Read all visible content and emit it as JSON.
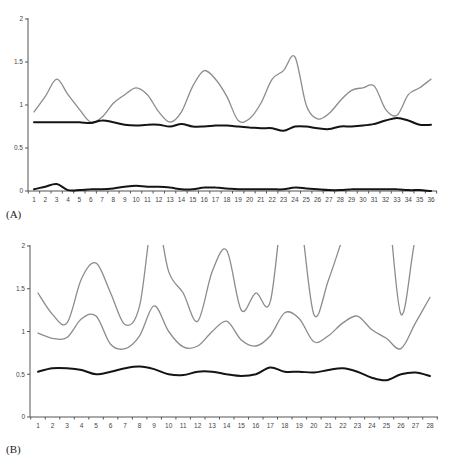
{
  "chart_data": [
    {
      "type": "line",
      "panel_label": "(A)",
      "title": "",
      "xlabel": "",
      "ylabel": "",
      "x": [
        1,
        2,
        3,
        4,
        5,
        6,
        7,
        8,
        9,
        10,
        11,
        12,
        13,
        14,
        15,
        16,
        17,
        18,
        19,
        20,
        21,
        22,
        23,
        24,
        25,
        26,
        27,
        28,
        29,
        30,
        31,
        32,
        33,
        34,
        35,
        36
      ],
      "xticks": [
        "1",
        "2",
        "3",
        "4",
        "5",
        "6",
        "7",
        "8",
        "9",
        "10",
        "11",
        "12",
        "13",
        "14",
        "15",
        "16",
        "17",
        "18",
        "19",
        "20",
        "21",
        "22",
        "23",
        "24",
        "25",
        "26",
        "27",
        "28",
        "29",
        "30",
        "31",
        "32",
        "33",
        "34",
        "35",
        "36"
      ],
      "yticks": [
        "0",
        "0.5",
        "1",
        "1.5",
        "2"
      ],
      "ytick_values": [
        0,
        0.5,
        1,
        1.5,
        2
      ],
      "ylim": [
        0,
        2
      ],
      "grid": false,
      "legend": "none",
      "series": [
        {
          "name": "grey-upper",
          "color": "#8c8c8c",
          "values": [
            0.92,
            1.1,
            1.3,
            1.12,
            0.95,
            0.8,
            0.86,
            1.02,
            1.12,
            1.2,
            1.12,
            0.92,
            0.8,
            0.92,
            1.22,
            1.4,
            1.3,
            1.1,
            0.82,
            0.84,
            1.02,
            1.3,
            1.4,
            1.56,
            1.0,
            0.84,
            0.9,
            1.05,
            1.17,
            1.2,
            1.22,
            0.95,
            0.88,
            1.12,
            1.2,
            1.3
          ]
        },
        {
          "name": "black-middle",
          "color": "#141414",
          "values": [
            0.8,
            0.8,
            0.8,
            0.8,
            0.8,
            0.79,
            0.82,
            0.8,
            0.77,
            0.76,
            0.77,
            0.77,
            0.75,
            0.78,
            0.75,
            0.75,
            0.76,
            0.76,
            0.75,
            0.74,
            0.73,
            0.73,
            0.7,
            0.75,
            0.75,
            0.73,
            0.72,
            0.75,
            0.75,
            0.76,
            0.78,
            0.82,
            0.85,
            0.82,
            0.77,
            0.77
          ]
        },
        {
          "name": "black-lower",
          "color": "#141414",
          "values": [
            0.02,
            0.05,
            0.08,
            0.01,
            0.01,
            0.02,
            0.02,
            0.03,
            0.05,
            0.06,
            0.05,
            0.05,
            0.04,
            0.02,
            0.02,
            0.04,
            0.04,
            0.03,
            0.02,
            0.02,
            0.02,
            0.02,
            0.02,
            0.04,
            0.03,
            0.02,
            0.01,
            0.01,
            0.02,
            0.02,
            0.02,
            0.02,
            0.02,
            0.01,
            0.01,
            0.0
          ]
        }
      ]
    },
    {
      "type": "line",
      "panel_label": "(B)",
      "title": "",
      "xlabel": "",
      "ylabel": "",
      "x": [
        1,
        2,
        3,
        4,
        5,
        6,
        7,
        8,
        9,
        10,
        11,
        12,
        13,
        14,
        15,
        16,
        17,
        18,
        19,
        20,
        21,
        22,
        23,
        24,
        25,
        26,
        27,
        28
      ],
      "xticks": [
        "1",
        "2",
        "3",
        "4",
        "5",
        "6",
        "7",
        "8",
        "9",
        "10",
        "11",
        "12",
        "13",
        "14",
        "15",
        "16",
        "17",
        "18",
        "19",
        "20",
        "21",
        "22",
        "23",
        "24",
        "25",
        "26",
        "27",
        "28"
      ],
      "yticks": [
        "0",
        "0.5",
        "1",
        "1.5",
        "2"
      ],
      "ytick_values": [
        0,
        0.5,
        1,
        1.5,
        2
      ],
      "ylim": [
        0,
        2
      ],
      "grid": false,
      "legend": "none",
      "clipped_above_ylim": true,
      "series": [
        {
          "name": "grey-upper",
          "color": "#8c8c8c",
          "values": [
            1.45,
            1.2,
            1.1,
            1.62,
            1.8,
            1.45,
            1.08,
            1.3,
            2.4,
            1.7,
            1.45,
            1.12,
            1.7,
            1.95,
            1.25,
            1.45,
            1.35,
            2.6,
            2.4,
            1.2,
            1.6,
            2.1,
            2.6,
            2.6,
            2.6,
            1.2,
            2.1,
            2.6
          ]
        },
        {
          "name": "grey-middle",
          "color": "#8c8c8c",
          "values": [
            0.98,
            0.92,
            0.93,
            1.15,
            1.18,
            0.85,
            0.8,
            0.95,
            1.3,
            1.0,
            0.82,
            0.83,
            1.0,
            1.12,
            0.9,
            0.83,
            0.95,
            1.22,
            1.15,
            0.88,
            0.95,
            1.1,
            1.18,
            1.02,
            0.92,
            0.8,
            1.1,
            1.4
          ]
        },
        {
          "name": "black-lower",
          "color": "#141414",
          "values": [
            0.53,
            0.57,
            0.57,
            0.55,
            0.5,
            0.53,
            0.57,
            0.59,
            0.56,
            0.5,
            0.49,
            0.53,
            0.53,
            0.5,
            0.48,
            0.5,
            0.58,
            0.53,
            0.53,
            0.52,
            0.55,
            0.57,
            0.53,
            0.46,
            0.43,
            0.5,
            0.52,
            0.48
          ]
        }
      ]
    }
  ]
}
